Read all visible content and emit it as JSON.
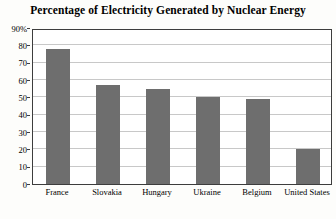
{
  "chart_data": {
    "type": "bar",
    "title": "Percentage of Electricity Generated by Nuclear Energy",
    "xlabel": "",
    "ylabel": "",
    "categories": [
      "France",
      "Slovakia",
      "Hungary",
      "Ukraine",
      "Belgium",
      "United States"
    ],
    "values": [
      78,
      57,
      55,
      50,
      49,
      20
    ],
    "ylim": [
      0,
      90
    ],
    "yticks": [
      0,
      10,
      20,
      30,
      40,
      50,
      60,
      70,
      80,
      90
    ],
    "ytick_labels": [
      "0",
      "10",
      "20",
      "30",
      "40",
      "50",
      "60",
      "70",
      "80",
      "90%"
    ],
    "grid": true,
    "legend": false,
    "bar_color": "#6e6e6e",
    "grid_color": "#c8c8c8",
    "frame_color": "#3d3d3d",
    "background": "#ffffff"
  }
}
